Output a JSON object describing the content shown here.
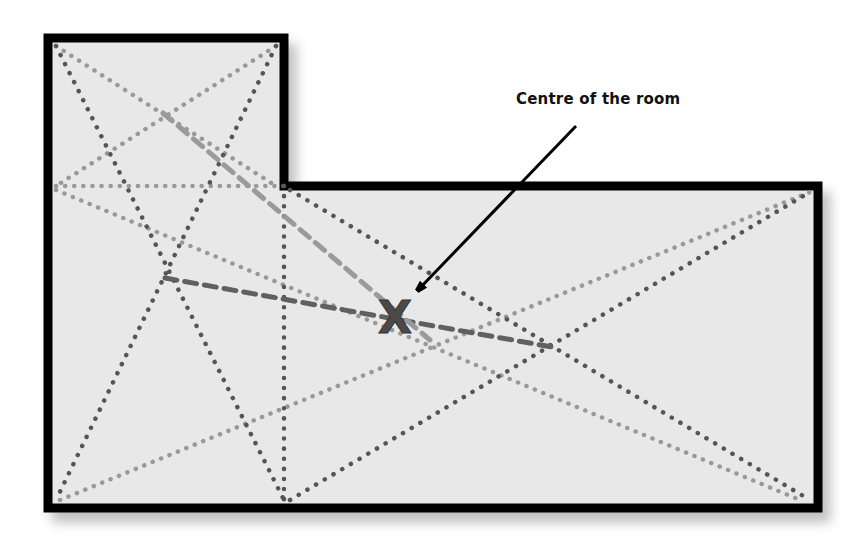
{
  "annotation": {
    "label": "Centre of the room",
    "marker": "X"
  },
  "colors": {
    "room_fill": "#e8e8e8",
    "wall": "#000000",
    "dark_dots": "#555555",
    "light_dots": "#999999",
    "dashed_dark": "#606060",
    "dashed_light": "#9a9a9a",
    "marker": "#4a4a4a",
    "text": "#111111"
  },
  "room": {
    "outline_points": "48,38 284,38 284,186 818,186 818,508 48,508"
  },
  "diagonals_dark": [
    {
      "x1": 56,
      "y1": 46,
      "x2": 284,
      "y2": 500
    },
    {
      "x1": 276,
      "y1": 46,
      "x2": 56,
      "y2": 500
    },
    {
      "x1": 284,
      "y1": 186,
      "x2": 284,
      "y2": 500
    },
    {
      "x1": 290,
      "y1": 190,
      "x2": 810,
      "y2": 500
    },
    {
      "x1": 290,
      "y1": 500,
      "x2": 810,
      "y2": 192
    }
  ],
  "diagonals_light": [
    {
      "x1": 56,
      "y1": 46,
      "x2": 276,
      "y2": 186
    },
    {
      "x1": 276,
      "y1": 46,
      "x2": 56,
      "y2": 186
    },
    {
      "x1": 56,
      "y1": 186,
      "x2": 284,
      "y2": 186
    },
    {
      "x1": 56,
      "y1": 190,
      "x2": 800,
      "y2": 500
    },
    {
      "x1": 60,
      "y1": 500,
      "x2": 810,
      "y2": 192
    }
  ],
  "centroid_links": [
    {
      "x1": 165,
      "y1": 278,
      "x2": 552,
      "y2": 347,
      "tone": "dark"
    },
    {
      "x1": 163,
      "y1": 113,
      "x2": 430,
      "y2": 340,
      "tone": "light"
    }
  ],
  "marker_pos": {
    "x": 395,
    "y": 317
  },
  "arrow": {
    "x1": 576,
    "y1": 126,
    "x2": 418,
    "y2": 290
  }
}
